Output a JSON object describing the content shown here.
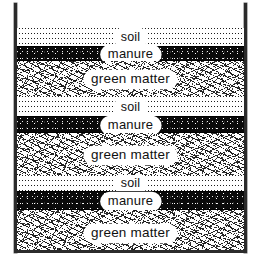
{
  "figure": {
    "name": "compost-bin-layer-cross-section",
    "container": {
      "wall_color": "#2b2b2b",
      "background_color": "#ffffff"
    },
    "layers": [
      {
        "id": "soil-1",
        "material": "soil",
        "label": "soil",
        "texture": "stipple",
        "top": 0,
        "height": 18
      },
      {
        "id": "manure-1",
        "material": "manure",
        "label": "manure",
        "texture": "black",
        "top": 18,
        "height": 15
      },
      {
        "id": "green-1",
        "material": "green matter",
        "label": "green matter",
        "texture": "hatching",
        "top": 33,
        "height": 35
      },
      {
        "id": "soil-2",
        "material": "soil",
        "label": "soil",
        "texture": "stipple",
        "top": 68,
        "height": 20
      },
      {
        "id": "manure-2",
        "material": "manure",
        "label": "manure",
        "texture": "black",
        "top": 88,
        "height": 17
      },
      {
        "id": "green-2",
        "material": "green matter",
        "label": "green matter",
        "texture": "hatching",
        "top": 105,
        "height": 42
      },
      {
        "id": "soil-3",
        "material": "soil",
        "label": "soil",
        "texture": "stipple",
        "top": 147,
        "height": 16
      },
      {
        "id": "manure-3",
        "material": "manure",
        "label": "manure",
        "texture": "black",
        "top": 163,
        "height": 19
      },
      {
        "id": "green-3",
        "material": "green matter",
        "label": "green matter",
        "texture": "hatching",
        "top": 182,
        "height": 40
      }
    ]
  }
}
